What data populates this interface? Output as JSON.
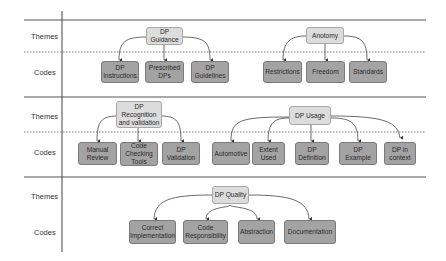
{
  "row_labels": {
    "themes": "Themes",
    "codes": "Codes"
  },
  "colors": {
    "theme_fill": "#dcdcdc",
    "code_fill": "#a3a3a3",
    "line": "#555555"
  },
  "sections": [
    {
      "themes": [
        {
          "label": "DP\nGuidance",
          "codes": [
            "DP\nInstructions",
            "Prescribed\nDPs",
            "DP\nGuidelines"
          ]
        },
        {
          "label": "Anotomy",
          "codes": [
            "Restrictions",
            "Freedom",
            "Standards"
          ]
        }
      ]
    },
    {
      "themes": [
        {
          "label": "DP\nRecognition\nand validation",
          "codes": [
            "Manual\nReview",
            "Code\nChecking\nTools",
            "DP\nValidation"
          ]
        },
        {
          "label": "DP Usage",
          "codes": [
            "Automotive",
            "Extent\nUsed",
            "DP\nDefinition",
            "DP\nExample",
            "DP in\ncontext"
          ]
        }
      ]
    },
    {
      "themes": [
        {
          "label": "DP Quality",
          "codes": [
            "Correct\nImplementation",
            "Code\nResponsibility",
            "Abstraction",
            "Documentation"
          ]
        }
      ]
    }
  ]
}
